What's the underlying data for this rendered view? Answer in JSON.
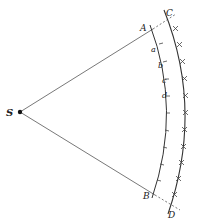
{
  "diagram": {
    "labels": {
      "S": "S",
      "A": "A",
      "B": "B",
      "C": "C",
      "D": "D",
      "a": "a",
      "b": "b",
      "c": "c",
      "d": "d"
    },
    "colors": {
      "line": "#333333",
      "dot": "#111111"
    }
  }
}
